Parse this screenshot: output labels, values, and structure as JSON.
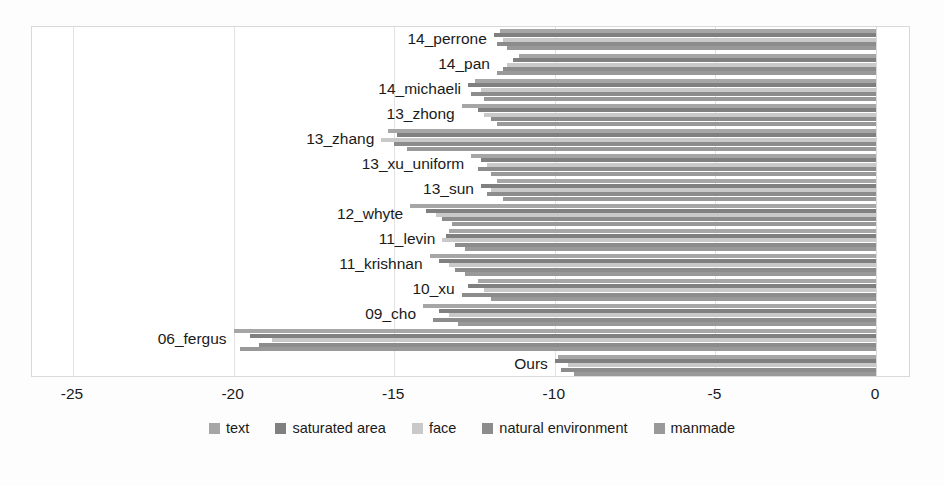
{
  "chart_data": {
    "type": "bar",
    "orientation": "horizontal",
    "stacked": false,
    "title": "",
    "xlabel": "",
    "ylabel": "",
    "xlim": [
      -25,
      0
    ],
    "xticks": [
      -25,
      -20,
      -15,
      -10,
      -5,
      0
    ],
    "xtick_labels": [
      "-25",
      "-20",
      "-15",
      "-10",
      "-5",
      "0"
    ],
    "grid": true,
    "legend_position": "bottom",
    "categories": [
      "14_perrone",
      "14_pan",
      "14_michaeli",
      "13_zhong",
      "13_zhang",
      "13_xu_uniform",
      "13_sun",
      "12_whyte",
      "11_levin",
      "11_krishnan",
      "10_xu",
      "09_cho",
      "06_fergus",
      "Ours"
    ],
    "series": [
      {
        "name": "text",
        "color": "#a6a6a6",
        "values": [
          -11.7,
          -11.1,
          -12.5,
          -12.9,
          -15.2,
          -12.6,
          -11.8,
          -14.5,
          -13.3,
          -13.9,
          -12.4,
          -14.1,
          -20.0,
          -9.9
        ]
      },
      {
        "name": "saturated area",
        "color": "#808080",
        "values": [
          -11.9,
          -11.3,
          -12.7,
          -12.4,
          -14.9,
          -12.3,
          -12.3,
          -14.0,
          -13.4,
          -13.6,
          -12.7,
          -13.6,
          -19.5,
          -10.0
        ]
      },
      {
        "name": "face",
        "color": "#c9c9c9",
        "values": [
          -11.6,
          -11.5,
          -12.3,
          -12.2,
          -15.4,
          -12.1,
          -12.0,
          -13.7,
          -13.5,
          -13.3,
          -12.2,
          -13.3,
          -18.8,
          -9.6
        ]
      },
      {
        "name": "natural environment",
        "color": "#8c8c8c",
        "values": [
          -11.8,
          -11.6,
          -12.6,
          -12.0,
          -15.0,
          -12.4,
          -12.1,
          -13.5,
          -13.1,
          -13.1,
          -12.9,
          -13.8,
          -19.2,
          -9.8
        ]
      },
      {
        "name": "manmade",
        "color": "#999999",
        "values": [
          -11.5,
          -11.8,
          -12.2,
          -11.8,
          -14.6,
          -12.0,
          -11.6,
          -13.2,
          -12.8,
          -12.8,
          -12.0,
          -13.0,
          -19.8,
          -9.4
        ]
      }
    ]
  },
  "legend": {
    "items": [
      {
        "label": "text",
        "color": "#a6a6a6"
      },
      {
        "label": "saturated area",
        "color": "#808080"
      },
      {
        "label": "face",
        "color": "#c9c9c9"
      },
      {
        "label": "natural environment",
        "color": "#8c8c8c"
      },
      {
        "label": "manmade",
        "color": "#999999"
      }
    ]
  }
}
